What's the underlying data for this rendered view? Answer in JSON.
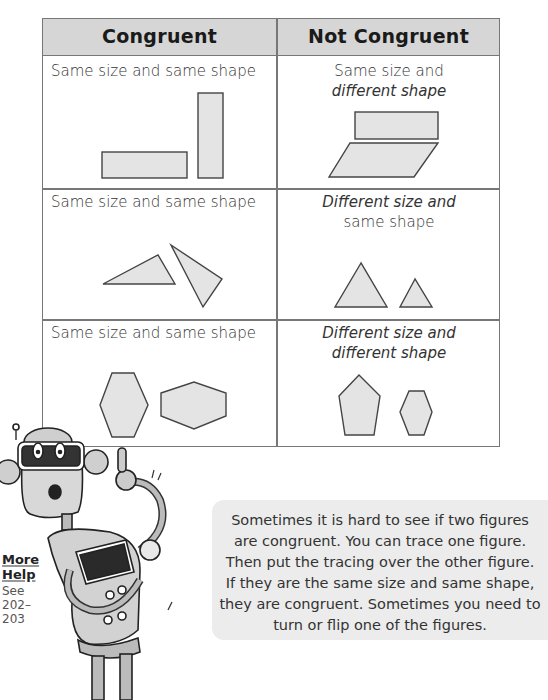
{
  "table": {
    "headers": [
      "Congruent",
      "Not Congruent"
    ],
    "rows": [
      {
        "congruent": {
          "label": "Same size and same shape",
          "shapes": "two-rectangles"
        },
        "not_congruent": {
          "label_line1": "Same size and",
          "label_line2": "different shape",
          "shapes": "rectangle-and-parallelogram"
        }
      },
      {
        "congruent": {
          "label": "Same size and same shape",
          "shapes": "two-triangles"
        },
        "not_congruent": {
          "label_line1": "Different size and",
          "label_line2": "same shape",
          "shapes": "large-and-small-triangle"
        }
      },
      {
        "congruent": {
          "label": "Same size and same shape",
          "shapes": "two-hexagons"
        },
        "not_congruent": {
          "label_line1": "Different size and",
          "label_line2": "different shape",
          "shapes": "pentagon-and-small-hexagon"
        }
      }
    ]
  },
  "colors": {
    "header_bg": "#d6d6d6",
    "shape_fill": "#e4e4e4",
    "shape_stroke": "#444444",
    "border": "#777777",
    "bubble_bg": "#ececec"
  },
  "more_help": {
    "title_line1": "More",
    "title_line2": "Help",
    "see": "See",
    "pages_line1": "202–",
    "pages_line2": "203"
  },
  "bubble": {
    "lines": [
      "Sometimes it is hard to see if two figures",
      "are congruent. You can trace one figure.",
      "Then put the tracing over the other figure.",
      "If they are the same size and same shape,",
      "they are congruent. Sometimes you need to",
      "turn or flip one of the figures."
    ]
  },
  "illustration": {
    "name": "robot-mascot"
  }
}
